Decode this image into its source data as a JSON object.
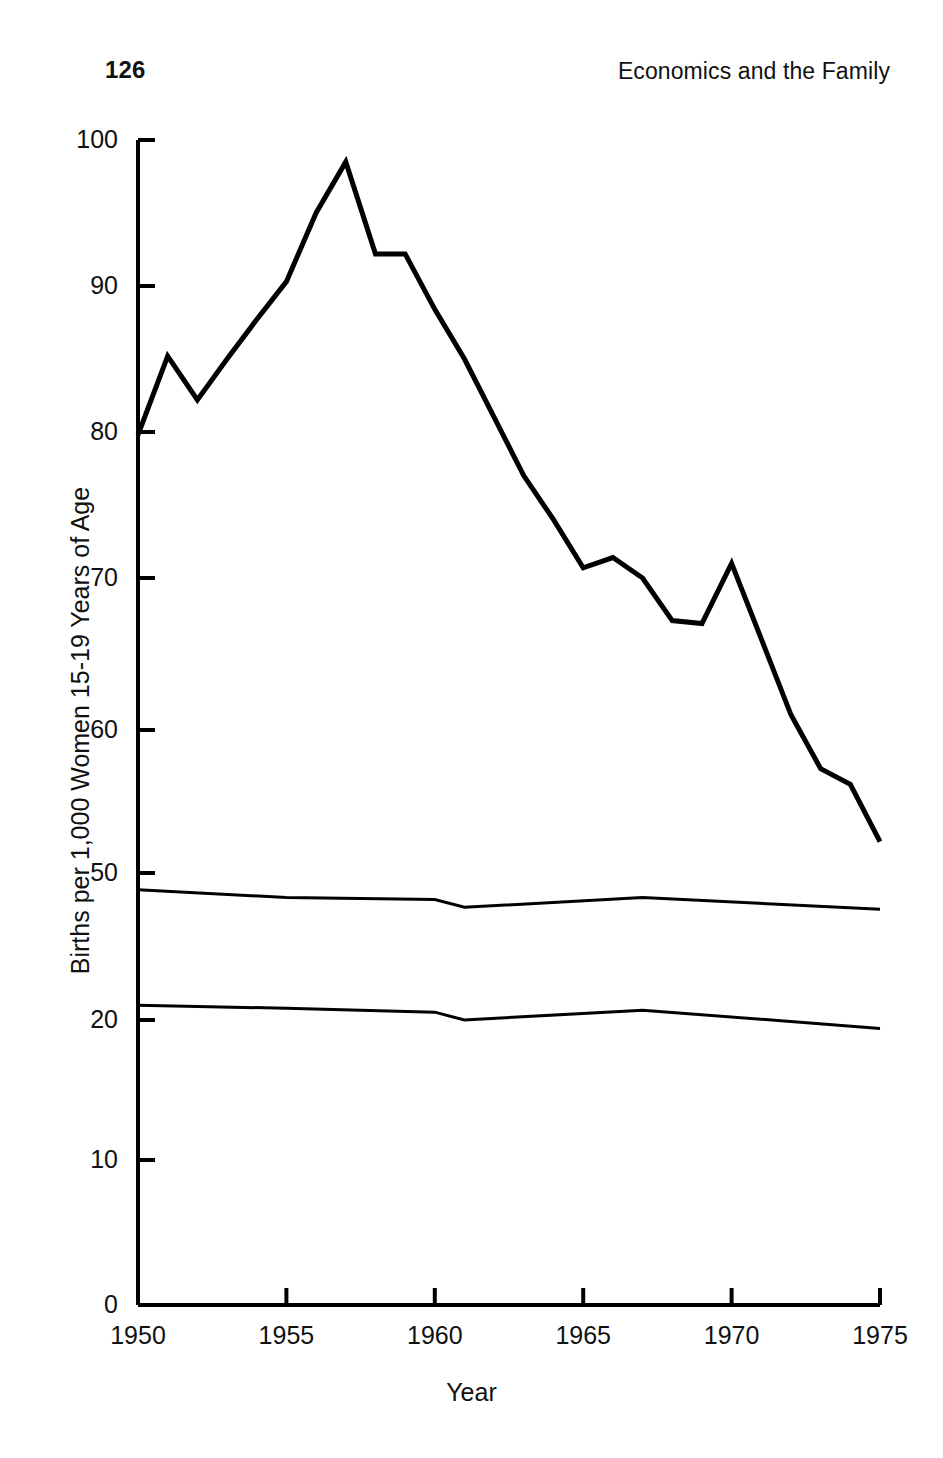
{
  "header": {
    "folio": "126",
    "book_title": "Economics and the Family"
  },
  "chart_data": {
    "type": "line",
    "title": "",
    "xlabel": "Year",
    "ylabel": "Births per 1,000 Women 15-19 Years of Age",
    "xlim": [
      1950,
      1975
    ],
    "xticks": [
      1950,
      1955,
      1960,
      1965,
      1970,
      1975
    ],
    "xticklabels": [
      "1950",
      "1955",
      "1960",
      "1965",
      "1970",
      "1975"
    ],
    "ylim": [
      0,
      100
    ],
    "yticks": [
      0,
      10,
      20,
      50,
      60,
      70,
      80,
      90,
      100
    ],
    "yticklabels": [
      "0",
      "10",
      "20",
      "50",
      "60",
      "70",
      "80",
      "90",
      "100"
    ],
    "axis_note": "y-axis is broken/compressed between 20 and 50",
    "grid": false,
    "legend": "none",
    "line_color": "#000000",
    "series": [
      {
        "name": "Total births per 1,000 women 15-19",
        "linewidth": 5,
        "x": [
          1950,
          1951,
          1952,
          1953,
          1954,
          1955,
          1956,
          1957,
          1958,
          1959,
          1960,
          1961,
          1962,
          1963,
          1964,
          1965,
          1966,
          1967,
          1968,
          1969,
          1970,
          1971,
          1972,
          1973,
          1974,
          1975
        ],
        "values": [
          79.8,
          85.2,
          82.2,
          85.0,
          87.7,
          90.3,
          95.0,
          98.5,
          92.2,
          92.2,
          88.4,
          85.0,
          81.0,
          77.0,
          74.0,
          70.7,
          71.4,
          70.0,
          67.2,
          67.0,
          71.0,
          66.0,
          61.0,
          57.3,
          56.2,
          52.2
        ]
      },
      {
        "name": "Middle series",
        "linewidth": 3,
        "x": [
          1950,
          1955,
          1960,
          1961,
          1967,
          1975
        ],
        "values": [
          46.6,
          45.0,
          44.6,
          43.0,
          45.0,
          42.6
        ]
      },
      {
        "name": "Lower series",
        "linewidth": 3,
        "x": [
          1950,
          1955,
          1960,
          1961,
          1967,
          1975
        ],
        "values": [
          23.0,
          22.4,
          21.6,
          20.0,
          22.0,
          19.4
        ]
      }
    ]
  },
  "axis_geometry": {
    "note": "pixel anchors used to recreate broken-axis mapping",
    "x_left_px": 138,
    "x_right_px": 880,
    "y_anchor_values": [
      0,
      10,
      20,
      50,
      60,
      70,
      80,
      90,
      100
    ],
    "y_anchor_px": [
      1305,
      1160,
      1020,
      873,
      730,
      578,
      432,
      286,
      140
    ]
  }
}
